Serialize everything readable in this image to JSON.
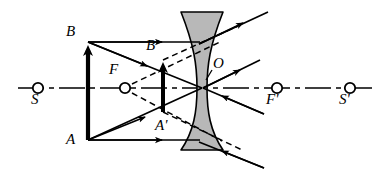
{
  "figure": {
    "type": "optics-ray-diagram",
    "background_color": "#ffffff",
    "stroke_color": "#000000",
    "lens_fill_color": "#b8b8b8"
  },
  "axis": {
    "name": "principal-optical-axis",
    "style": "dash-dot",
    "y": 88,
    "x_start": 18,
    "x_end": 376
  },
  "lens": {
    "name": "diverging-lens",
    "kind": "biconcave",
    "center_x": 202,
    "top_y": 12,
    "bottom_y": 150,
    "top_half_width": 21,
    "waist_half_width": 5,
    "fill": "#b8b8b8"
  },
  "axis_points": [
    {
      "id": "S",
      "label": "S",
      "x": 38,
      "y": 88,
      "label_x": 31,
      "label_y": 94
    },
    {
      "id": "F",
      "label": "F",
      "x": 125,
      "y": 88,
      "label_x": 110,
      "label_y": 68
    },
    {
      "id": "Fp",
      "label": "F'",
      "x": 277,
      "y": 88,
      "label_x": 268,
      "label_y": 94
    },
    {
      "id": "Sp",
      "label": "S'",
      "x": 350,
      "y": 88,
      "label_x": 341,
      "label_y": 94
    }
  ],
  "optical_center": {
    "id": "O",
    "label": "O",
    "x": 202,
    "y": 88,
    "label_x": 212,
    "label_y": 62
  },
  "object_arrow": {
    "name": "object-arrow-AB",
    "x": 88,
    "base_y": 140,
    "tip_y": 42,
    "direction": "up",
    "base_label": "A",
    "tip_label": "B",
    "base_label_x": 70,
    "base_label_y": 132,
    "tip_label_x": 70,
    "tip_label_y": 26
  },
  "image_arrow": {
    "name": "image-arrow-A-prime-B-prime",
    "x": 163,
    "base_y": 112,
    "tip_y": 60,
    "direction": "up",
    "base_label": "A'",
    "tip_label": "B'",
    "base_label_x": 160,
    "base_label_y": 118,
    "tip_label_x": 150,
    "tip_label_y": 40
  },
  "labels": [
    {
      "text": "S",
      "name": "label-S"
    },
    {
      "text": "B",
      "name": "label-B"
    },
    {
      "text": "F",
      "name": "label-F"
    },
    {
      "text": "B'",
      "name": "label-B-prime"
    },
    {
      "text": "O",
      "name": "label-O"
    },
    {
      "text": "A",
      "name": "label-A"
    },
    {
      "text": "A'",
      "name": "label-A-prime"
    },
    {
      "text": "F'",
      "name": "label-F-prime"
    },
    {
      "text": "S'",
      "name": "label-S-prime"
    }
  ],
  "rays": {
    "solid_incident": [
      {
        "name": "ray-B-parallel-to-axis",
        "points": "88,42 202,42",
        "arrow_at": 0.62
      },
      {
        "name": "ray-A-parallel-to-axis",
        "points": "88,140 202,140",
        "arrow_at": 0.62
      },
      {
        "name": "ray-B-through-center",
        "points": "88,42 202,88",
        "arrow_at": 0.48
      },
      {
        "name": "ray-A-through-center",
        "points": "88,140 202,88",
        "arrow_at": 0.48
      }
    ],
    "solid_refracted": [
      {
        "name": "ray-refracted-upper-outgoing",
        "points": "198,44 265,14",
        "arrow_at": 0.55
      },
      {
        "name": "ray-refracted-center-upper",
        "points": "202,88 258,62",
        "arrow_at": 0.55
      },
      {
        "name": "ray-refracted-center-lower",
        "points": "202,88 262,112",
        "arrow_at": 0.5
      },
      {
        "name": "ray-refracted-lower-outgoing",
        "points": "198,142 262,166",
        "arrow_at": 0.5
      }
    ],
    "dashed_virtual": [
      {
        "name": "virtual-ray-F-to-upper-edge",
        "points": "130,85 222,42"
      },
      {
        "name": "virtual-ray-F-to-lower-edge",
        "points": "130,92 222,140"
      },
      {
        "name": "virtual-extension-upper-right",
        "points": "163,60 236,28"
      },
      {
        "name": "virtual-extension-lower-right",
        "points": "163,112 240,148"
      }
    ]
  }
}
